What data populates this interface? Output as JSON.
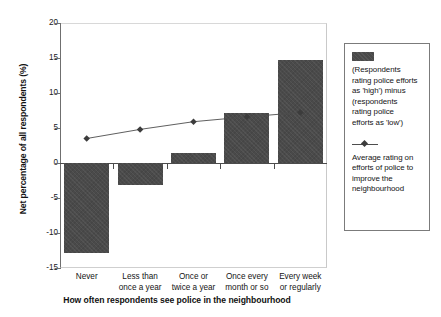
{
  "chart_data": {
    "type": "bar",
    "title": "",
    "xlabel": "How often respondents see police in the neighbourhood",
    "ylabel": "Net percentage of all respondents (%)",
    "categories": [
      "Never",
      "Less than once a year",
      "Once or twice a year",
      "Once every month or so",
      "Every week or regularly"
    ],
    "category_lines": [
      [
        "Never",
        ""
      ],
      [
        "Less than",
        "once a year"
      ],
      [
        "Once or",
        "twice a year"
      ],
      [
        "Once every",
        "month or so"
      ],
      [
        "Every week",
        "or regularly"
      ]
    ],
    "ylim": [
      -15,
      20
    ],
    "yticks": [
      20,
      15,
      10,
      5,
      0,
      -5,
      -10,
      -15
    ],
    "ytick_labels": [
      "20",
      "15",
      "10",
      "5",
      "0",
      "-5",
      "-10",
      "-15"
    ],
    "grid": false,
    "legend_position": "right",
    "series": [
      {
        "name": "(Respondents rating police efforts as 'high') minus (respondents rating police efforts as 'low')",
        "type": "bar",
        "color": "#4a4a4a",
        "values": [
          -12.8,
          -3.2,
          1.5,
          7.2,
          14.7
        ]
      },
      {
        "name": "Average rating on efforts of police to improve the neighbourhood",
        "type": "line",
        "color": "#4d4d4d",
        "marker": "diamond",
        "values": [
          3.5,
          4.8,
          5.9,
          6.6,
          7.2
        ]
      }
    ]
  },
  "axes": {
    "y_title": "Net percentage of all respondents (%)",
    "x_title": "How often respondents see police in the neighbourhood"
  },
  "legend": {
    "bar_entry": {
      "swatch_name": "bar-swatch",
      "lines": [
        "(Respondents",
        "rating police efforts",
        "as 'high') minus",
        "(respondents",
        "rating police",
        "efforts as 'low')"
      ]
    },
    "line_entry": {
      "marker_name": "line-marker",
      "lines": [
        "Average rating on",
        "efforts of police to",
        "improve the",
        "neighbourhood"
      ]
    }
  },
  "colors": {
    "bar": "#4a4a4a",
    "line": "#4d4d4d",
    "axis": "#4c4c4c",
    "frame": "#c9c9c9",
    "background": "#ffffff"
  }
}
